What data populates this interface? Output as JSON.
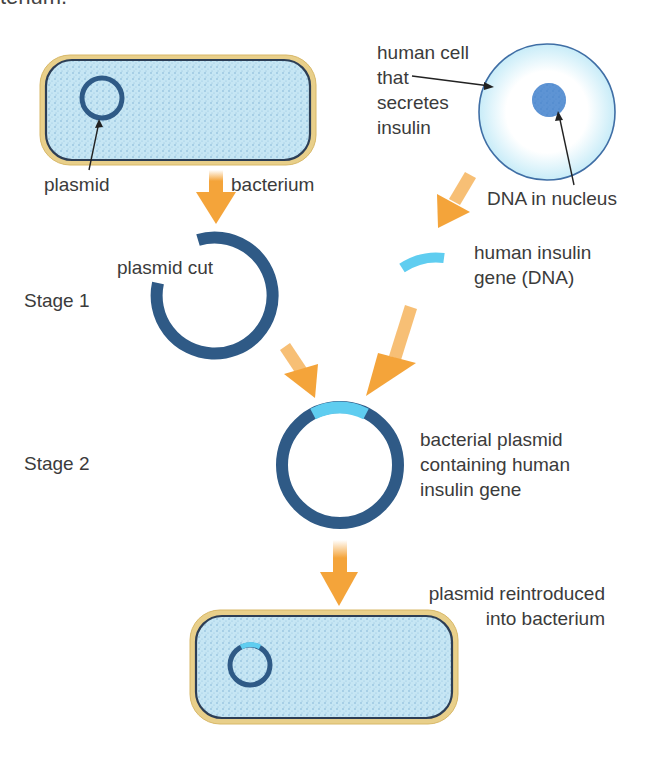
{
  "header_fragment": "terium.",
  "labels": {
    "plasmid": "plasmid",
    "bacterium": "bacterium",
    "human_cell": [
      "human cell",
      "that",
      "secretes",
      "insulin"
    ],
    "dna_in_nucleus": "DNA in nucleus",
    "plasmid_cut": "plasmid cut",
    "stage1": "Stage 1",
    "human_insulin_gene": [
      "human insulin",
      "gene (DNA)"
    ],
    "stage2": "Stage 2",
    "recombinant_plasmid": [
      "bacterial plasmid",
      "containing human",
      "insulin gene"
    ],
    "reintroduced": [
      "plasmid reintroduced",
      "into bacterium"
    ]
  },
  "colors": {
    "cell_wall": "#e8cf8a",
    "membrane": "#2d3e55",
    "cytoplasm": "#bfe2f2",
    "plasmid": "#2f5a86",
    "insulin_gene": "#5fcdf0",
    "arrow": "#f4a43a",
    "human_cell_fill": "#d9f3fb",
    "human_cell_edge": "#3f6ea5",
    "nucleus": "#3b78c9"
  }
}
